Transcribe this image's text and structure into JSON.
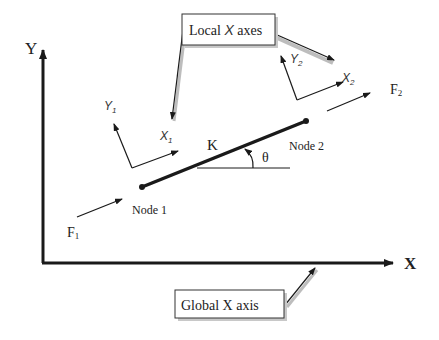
{
  "diagram": {
    "global_axes": {
      "y_label": "Y",
      "x_label": "X"
    },
    "callouts": {
      "local": {
        "prefix": "Local ",
        "italic": "X",
        "suffix": " axes"
      },
      "global": {
        "label": "Global X axis"
      }
    },
    "element": {
      "stiffness_label": "K",
      "angle_label": "θ"
    },
    "nodes": [
      {
        "label": "Node 1"
      },
      {
        "label": "Node 2"
      }
    ],
    "local_axes": [
      {
        "x_label": "X",
        "x_sub": "1",
        "y_label": "Y",
        "y_sub": "1"
      },
      {
        "x_label": "X",
        "x_sub": "2",
        "y_label": "Y",
        "y_sub": "2"
      }
    ],
    "forces": [
      {
        "label": "F",
        "sub": "1"
      },
      {
        "label": "F",
        "sub": "2"
      }
    ],
    "colors": {
      "line": "#1a1a1a",
      "shadow": "#bdbdbd"
    }
  }
}
